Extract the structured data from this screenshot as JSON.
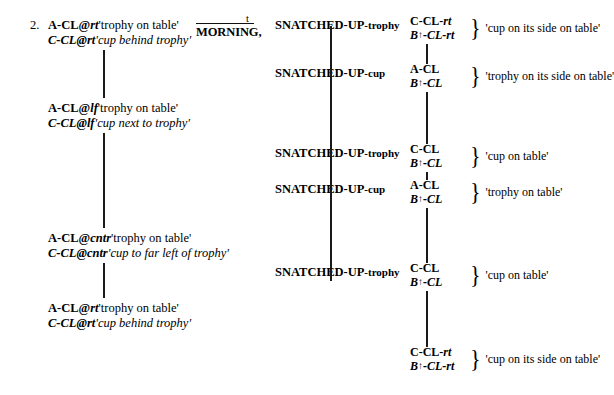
{
  "figure": {
    "example_number": "2.",
    "left_column": [
      {
        "id": "left-1",
        "top": 18,
        "line1_gloss": "A-CL@",
        "line1_loc": "rt",
        "line1_meaning": "'trophy on table'",
        "line2_gloss": "C-CL",
        "line2_at": "@",
        "line2_loc": "rt",
        "line2_meaning": "'cup behind trophy'"
      },
      {
        "id": "left-2",
        "top": 101,
        "line1_gloss": "A-CL@",
        "line1_loc": "lf",
        "line1_meaning": "'trophy on table'",
        "line2_gloss": "C-CL",
        "line2_at": "@",
        "line2_loc": "lf",
        "line2_meaning": "'cup next to trophy'"
      },
      {
        "id": "left-3",
        "top": 231,
        "line1_gloss": "A-CL@",
        "line1_loc": "cntr",
        "line1_meaning": "'trophy on table'",
        "line2_gloss": "C-CL",
        "line2_at": "@",
        "line2_loc": "cntr",
        "line2_meaning": "'cup to far left of trophy'"
      },
      {
        "id": "left-4",
        "top": 301,
        "line1_gloss": "A-CL@",
        "line1_loc": "rt",
        "line1_meaning": "'trophy on table'",
        "line2_gloss": "C-CL",
        "line2_at": "@",
        "line2_loc": "rt",
        "line2_meaning": "'cup behind trophy'"
      }
    ],
    "left_lines": [
      {
        "id": "left-vline-1",
        "top": 50,
        "height": 48
      },
      {
        "id": "left-vline-2",
        "top": 133,
        "height": 95
      },
      {
        "id": "left-vline-3",
        "top": 263,
        "height": 35
      }
    ],
    "morning": {
      "topic_marker": "t",
      "gloss": "MORNING,"
    },
    "middle_column": [
      {
        "id": "snatch-1",
        "top": 18,
        "main": "SNATCHED-UP",
        "tail": "-trophy"
      },
      {
        "id": "snatch-2",
        "top": 66,
        "main": "SNATCHED-UP",
        "tail": "-cup"
      },
      {
        "id": "snatch-3",
        "top": 146,
        "main": "SNATCHED-UP",
        "tail": "-trophy"
      },
      {
        "id": "snatch-4",
        "top": 182,
        "main": "SNATCHED-UP",
        "tail": "-cup"
      },
      {
        "id": "snatch-5",
        "top": 265,
        "main": "SNATCHED-UP",
        "tail": "-trophy"
      }
    ],
    "middle_lines": [
      {
        "id": "mid-vline-1",
        "top": 26,
        "height": 255
      }
    ],
    "right_column": [
      {
        "id": "right-1",
        "top": 14,
        "top_main": "C-CL-",
        "top_sub": "rt",
        "bot_prefix": "B",
        "bot_arrow": "↑",
        "bot_main": "-CL-",
        "bot_sub": "rt",
        "brace": "}",
        "gloss": "'cup on its side on table'"
      },
      {
        "id": "right-2",
        "top": 62,
        "top_main": "A-CL",
        "top_sub": "",
        "bot_prefix": "B",
        "bot_arrow": "↑",
        "bot_main": "-CL",
        "bot_sub": "",
        "brace": "}",
        "gloss": "'trophy on its side on table'"
      },
      {
        "id": "right-3",
        "top": 142,
        "top_main": "C-CL",
        "top_sub": "",
        "bot_prefix": "B",
        "bot_arrow": "↑",
        "bot_main": "-CL",
        "bot_sub": "",
        "brace": "}",
        "gloss": "'cup on table'"
      },
      {
        "id": "right-4",
        "top": 178,
        "top_main": "A-CL",
        "top_sub": "",
        "bot_prefix": "B",
        "bot_arrow": "↑",
        "bot_main": "-CL",
        "bot_sub": "",
        "brace": "}",
        "gloss": "'trophy on table'"
      },
      {
        "id": "right-5",
        "top": 261,
        "top_main": "C-CL",
        "top_sub": "",
        "bot_prefix": "B",
        "bot_arrow": "↑",
        "bot_main": "-CL",
        "bot_sub": "",
        "brace": "}",
        "gloss": "'cup on table'"
      },
      {
        "id": "right-6",
        "top": 345,
        "top_main": "C-CL-",
        "top_sub": "rt",
        "bot_prefix": "B",
        "bot_arrow": "↑",
        "bot_main": "-CL-",
        "bot_sub": "rt",
        "brace": "}",
        "gloss": "'cup on its side on table'"
      }
    ],
    "right_lines": [
      {
        "id": "right-vline-1",
        "top": 44,
        "height": 20
      },
      {
        "id": "right-vline-2",
        "top": 92,
        "height": 52
      },
      {
        "id": "right-vline-3",
        "top": 172,
        "height": 8
      },
      {
        "id": "right-vline-4",
        "top": 208,
        "height": 55
      },
      {
        "id": "right-vline-5",
        "top": 291,
        "height": 56
      }
    ]
  }
}
